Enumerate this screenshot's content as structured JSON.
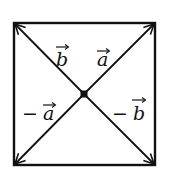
{
  "diagram": {
    "type": "square-with-diagonal-vectors",
    "square": {
      "x": 13,
      "y": 22,
      "width": 143,
      "height": 144
    },
    "center": {
      "x": 84,
      "y": 94
    },
    "stroke_color": "#111111",
    "vectors": [
      {
        "id": "a",
        "label": "a",
        "sign": "",
        "direction": "up-right",
        "tip": {
          "x": 155,
          "y": 23
        }
      },
      {
        "id": "b",
        "label": "b",
        "sign": "",
        "direction": "up-left",
        "tip": {
          "x": 14,
          "y": 23
        }
      },
      {
        "id": "neg-a",
        "label": "a",
        "sign": "−",
        "direction": "down-left",
        "tip": {
          "x": 14,
          "y": 165
        }
      },
      {
        "id": "neg-b",
        "label": "b",
        "sign": "−",
        "direction": "down-right",
        "tip": {
          "x": 155,
          "y": 165
        }
      }
    ],
    "labels": {
      "b": "b",
      "a": "a",
      "neg_a_sign": "−",
      "neg_a": "a",
      "neg_b_sign": "−",
      "neg_b": "b"
    }
  }
}
